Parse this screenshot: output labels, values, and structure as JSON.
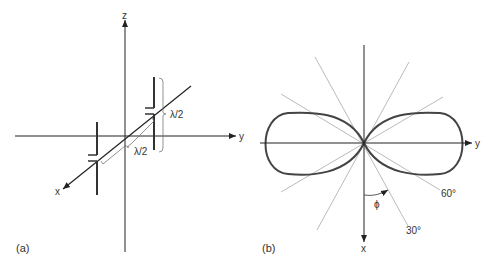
{
  "panel_a": {
    "label": "(a)",
    "axes": {
      "z": "z",
      "y": "y",
      "x": "x"
    },
    "dimensions": {
      "vertical": "λ/2",
      "diagonal": "λ/2"
    }
  },
  "panel_b": {
    "label": "(b)",
    "axes": {
      "y": "y",
      "x": "x"
    },
    "angle_symbol": "ϕ",
    "angle_labels": {
      "a60": "60°",
      "a30": "30°"
    }
  },
  "colors": {
    "axis": "#222222",
    "lobe": "#444444",
    "guide": "#bbbbbb",
    "text": "#333333"
  }
}
